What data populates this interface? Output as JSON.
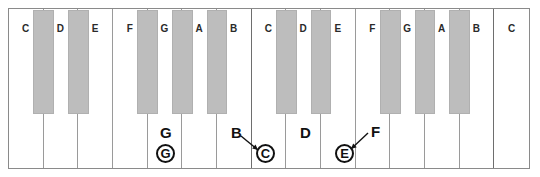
{
  "figure": {
    "key_count_white": 15,
    "key_count_black": 10,
    "colors": {
      "white_key": "#ffffff",
      "black_key": "#bdbdbd",
      "frame_border": "#8a8a8a",
      "divider": "#9a9a9a",
      "octave_divider": "#6e6e6e",
      "label_text": "#2a2a2a",
      "annotation_text": "#111111"
    }
  },
  "white_keys": [
    {
      "label": "C",
      "index": 0
    },
    {
      "label": "D",
      "index": 1
    },
    {
      "label": "E",
      "index": 2
    },
    {
      "label": "F",
      "index": 3
    },
    {
      "label": "G",
      "index": 4
    },
    {
      "label": "A",
      "index": 5
    },
    {
      "label": "B",
      "index": 6
    },
    {
      "label": "C",
      "index": 7
    },
    {
      "label": "D",
      "index": 8
    },
    {
      "label": "E",
      "index": 9
    },
    {
      "label": "F",
      "index": 10
    },
    {
      "label": "G",
      "index": 11
    },
    {
      "label": "A",
      "index": 12
    },
    {
      "label": "B",
      "index": 13
    },
    {
      "label": "C",
      "index": 14
    }
  ],
  "black_keys": [
    {
      "after_white_index": 0
    },
    {
      "after_white_index": 1
    },
    {
      "after_white_index": 3
    },
    {
      "after_white_index": 4
    },
    {
      "after_white_index": 5
    },
    {
      "after_white_index": 7
    },
    {
      "after_white_index": 8
    },
    {
      "after_white_index": 10
    },
    {
      "after_white_index": 11
    },
    {
      "after_white_index": 12
    }
  ],
  "annotations": [
    {
      "id": "ann-g",
      "plain_letter": "G",
      "circled_letter": "G",
      "has_arrow": false,
      "plain_x": 160,
      "plain_y": 125,
      "circle_x": 156,
      "circle_y": 144
    },
    {
      "id": "ann-b-c",
      "plain_letter": "B",
      "circled_letter": "C",
      "has_arrow": true,
      "plain_x": 231,
      "plain_y": 125,
      "circle_x": 256,
      "circle_y": 144,
      "arrow_x1": 241,
      "arrow_y1": 136,
      "arrow_x2": 258,
      "arrow_y2": 150
    },
    {
      "id": "ann-d",
      "plain_letter": "D",
      "circled_letter": "",
      "has_arrow": false,
      "plain_x": 300,
      "plain_y": 125,
      "circle_x": 0,
      "circle_y": 0
    },
    {
      "id": "ann-f-e",
      "plain_letter": "F",
      "circled_letter": "E",
      "has_arrow": true,
      "plain_x": 371,
      "plain_y": 124,
      "circle_x": 335,
      "circle_y": 144,
      "arrow_x1": 368,
      "arrow_y1": 133,
      "arrow_x2": 351,
      "arrow_y2": 149
    }
  ]
}
